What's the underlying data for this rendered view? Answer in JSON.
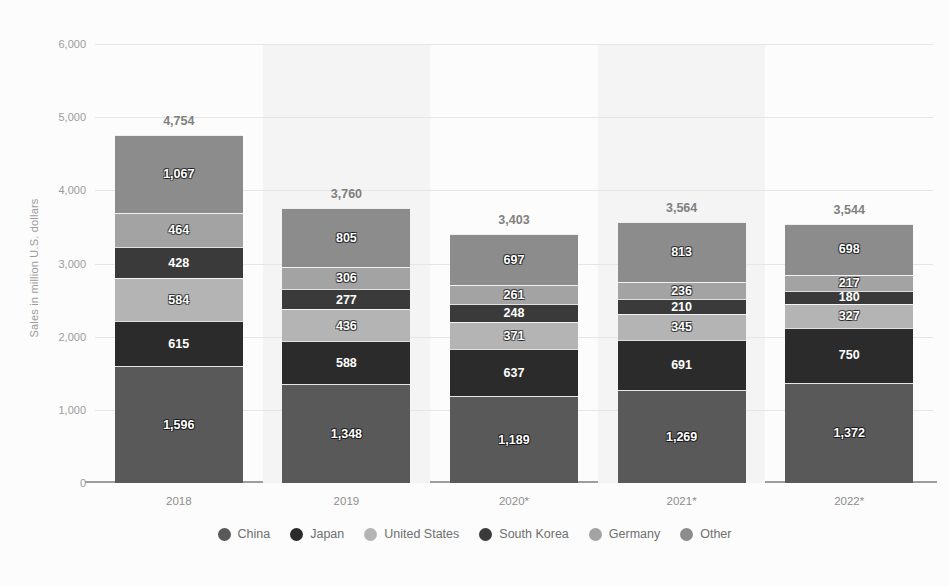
{
  "chart_data": {
    "type": "bar",
    "subtype": "stacked-bar",
    "title": "",
    "subtitle": "",
    "xlabel": "",
    "ylabel": "Sales in million U.S. dollars",
    "ylim": [
      0,
      6000
    ],
    "ytick_labels": [
      "6,000",
      "5,000",
      "4,000",
      "3,000",
      "2,000",
      "1,000",
      "0"
    ],
    "ytick_values": [
      6000,
      5000,
      4000,
      3000,
      2000,
      1000,
      0
    ],
    "grid": true,
    "legend_position": "bottom",
    "categories": [
      "2018",
      "2019",
      "2020*",
      "2021*",
      "2022*"
    ],
    "series": [
      {
        "name": "China",
        "color": "#595959",
        "values": [
          1596,
          1348,
          1189,
          1269,
          1372
        ],
        "labels": [
          "1,596",
          "1,348",
          "1,189",
          "1,269",
          "1,372"
        ]
      },
      {
        "name": "Japan",
        "color": "#2b2b2b",
        "values": [
          615,
          588,
          637,
          691,
          750
        ],
        "labels": [
          "615",
          "588",
          "637",
          "691",
          "750"
        ]
      },
      {
        "name": "United States",
        "color": "#b4b4b4",
        "values": [
          584,
          436,
          371,
          345,
          327
        ],
        "labels": [
          "584",
          "436",
          "371",
          "345",
          "327"
        ]
      },
      {
        "name": "South Korea",
        "color": "#3a3a3a",
        "values": [
          428,
          277,
          248,
          210,
          180
        ],
        "labels": [
          "428",
          "277",
          "248",
          "210",
          "180"
        ]
      },
      {
        "name": "Germany",
        "color": "#a3a3a3",
        "values": [
          464,
          306,
          261,
          236,
          217
        ],
        "labels": [
          "464",
          "306",
          "261",
          "236",
          "217"
        ]
      },
      {
        "name": "Other",
        "color": "#8c8c8c",
        "values": [
          1067,
          805,
          697,
          813,
          698
        ],
        "labels": [
          "1,067",
          "805",
          "697",
          "813",
          "698"
        ]
      }
    ],
    "totals": [
      4754,
      3760,
      3403,
      3564,
      3544
    ],
    "total_labels": [
      "4,754",
      "3,760",
      "3,403",
      "3,564",
      "3,544"
    ]
  },
  "style": {
    "background": "#fcfcfc",
    "band_color": "#f4f4f4",
    "gridline_color": "#e6e6e6",
    "axis_color": "#9d9d9d",
    "tick_text_color": "#9b9b9b",
    "total_text_color": "#808080",
    "legend_text_color": "#6f6f6f"
  }
}
